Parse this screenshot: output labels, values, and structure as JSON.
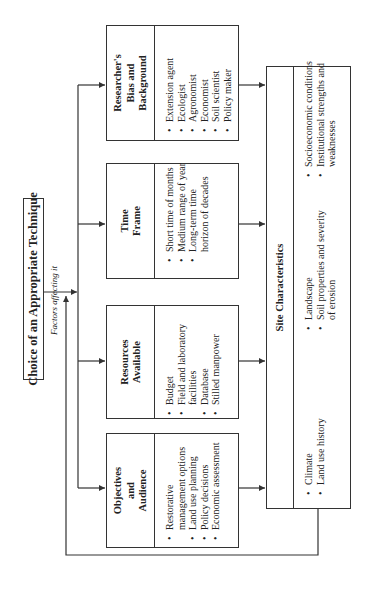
{
  "diagram": {
    "title": "Choice of an Appropriate Technique",
    "subtitle": "Factors affecting it",
    "orientation": "rotated 90° counter-clockwise",
    "factors": [
      {
        "id": "researchers-bias",
        "heading": "Researcher's Bias and Background",
        "items": [
          "Extension agent",
          "Ecologist",
          "Agronomist",
          "Economist",
          "Soil scientist",
          "Policy maker"
        ]
      },
      {
        "id": "time-frame",
        "heading": "Time Frame",
        "items": [
          "Short time of months",
          "Medium range of year",
          "Long-term time horizon of decades"
        ]
      },
      {
        "id": "resources-available",
        "heading": "Resources Available",
        "items": [
          "Budget",
          "Field and laboratory facilities",
          "Database",
          "Stilled manpower"
        ]
      },
      {
        "id": "objectives-audience",
        "heading": "Objectives and Audience",
        "items": [
          "Restorative management options",
          "Land use planning",
          "Policy decisions",
          "Economic assessment"
        ]
      }
    ],
    "site": {
      "heading": "Site Characteristics",
      "columns": [
        [
          "Climate",
          "Land use history"
        ],
        [
          "Landscape",
          "Soil properties and severity of erosion"
        ],
        [
          "Socioeconomic conditions",
          "Institutional strengths and weaknesses"
        ]
      ]
    },
    "colors": {
      "line": "#333333",
      "background": "#ffffff",
      "text": "#222222"
    }
  }
}
